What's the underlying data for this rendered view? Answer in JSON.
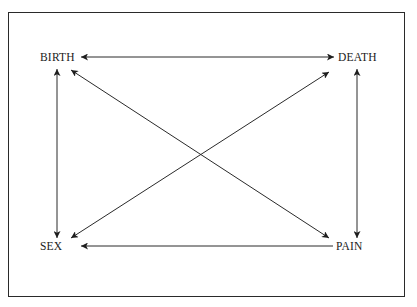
{
  "diagram": {
    "nodes": [
      {
        "id": "birth",
        "label": "BIRTH"
      },
      {
        "id": "death",
        "label": "DEATH"
      },
      {
        "id": "sex",
        "label": "SEX"
      },
      {
        "id": "pain",
        "label": "PAIN"
      }
    ],
    "edges": [
      {
        "from": "birth",
        "to": "death",
        "direction": "both"
      },
      {
        "from": "birth",
        "to": "sex",
        "direction": "both"
      },
      {
        "from": "death",
        "to": "pain",
        "direction": "both"
      },
      {
        "from": "pain",
        "to": "sex",
        "direction": "to"
      },
      {
        "from": "birth",
        "to": "pain",
        "direction": "both"
      },
      {
        "from": "sex",
        "to": "death",
        "direction": "both"
      }
    ],
    "colors": {
      "line": "#2a2a2a",
      "text": "#1a1a1a",
      "background": "#ffffff"
    }
  }
}
